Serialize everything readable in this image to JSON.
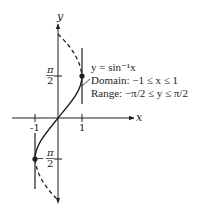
{
  "figure": {
    "axis_labels": {
      "x": "x",
      "y": "y"
    },
    "x_ticks": [
      {
        "label": "-1",
        "value": -1
      },
      {
        "label": "1",
        "value": 1
      }
    ],
    "y_ticks": [
      {
        "num": "π",
        "den": "2",
        "sign": "",
        "value": 1.5708
      },
      {
        "num": "π",
        "den": "2",
        "sign": "−",
        "value": -1.5708
      }
    ],
    "annotation": {
      "function": "y = sin⁻¹x",
      "domain": "Domain:  −1 ≤ x ≤ 1",
      "range": "Range: −π/2 ≤ y ≤ π/2"
    },
    "colors": {
      "ink": "#231f20",
      "background": "#ffffff"
    },
    "curves": [
      {
        "name": "arcsin",
        "style": "solid",
        "from": [
          -1,
          -1.5708
        ],
        "to": [
          1,
          1.5708
        ]
      },
      {
        "name": "continuation-top",
        "style": "dashed",
        "from": [
          1,
          1.5708
        ],
        "to": [
          0,
          3.1416
        ]
      },
      {
        "name": "continuation-bottom",
        "style": "dashed",
        "from": [
          -1,
          -1.5708
        ],
        "to": [
          0,
          -3.1416
        ]
      }
    ],
    "points": [
      {
        "x": 1,
        "y": 1.5708
      },
      {
        "x": -1,
        "y": -1.5708
      }
    ],
    "vertical_lines": [
      {
        "x": 1
      },
      {
        "x": -1
      }
    ]
  }
}
